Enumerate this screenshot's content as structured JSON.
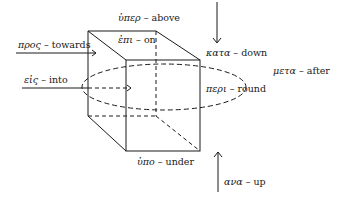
{
  "diagram": {
    "type": "prepositions-cube",
    "stroke_color": "#1a1a1a",
    "labels": [
      {
        "id": "hyper",
        "greek": "ὑπερ",
        "english": "above"
      },
      {
        "id": "epi",
        "greek": "ἐπι",
        "english": "on"
      },
      {
        "id": "pros",
        "greek": "προς",
        "english": "towards"
      },
      {
        "id": "eis",
        "greek": "εἰς",
        "english": "into"
      },
      {
        "id": "kata",
        "greek": "κατα",
        "english": "down"
      },
      {
        "id": "meta",
        "greek": "μετα",
        "english": "after"
      },
      {
        "id": "peri",
        "greek": "περι",
        "english": "round"
      },
      {
        "id": "hypo",
        "greek": "ὑπο",
        "english": "under"
      },
      {
        "id": "ana",
        "greek": "ανα",
        "english": "up"
      }
    ],
    "separator": " – "
  }
}
